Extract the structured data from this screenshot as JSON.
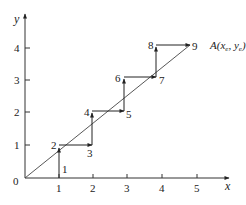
{
  "diagram": {
    "type": "staircase-interpolation",
    "axes": {
      "x_label": "x",
      "y_label": "y",
      "origin_label": "0",
      "x_ticks": [
        "1",
        "2",
        "3",
        "4",
        "5"
      ],
      "y_ticks": [
        "1",
        "2",
        "3",
        "4"
      ]
    },
    "endpoint_label": {
      "prefix": "A(",
      "x": "x",
      "x_sub": "e",
      "sep": ", ",
      "y": "y",
      "y_sub": "e",
      "suffix": ")"
    },
    "steps": [
      {
        "label": "1",
        "x": 1,
        "y": 0
      },
      {
        "label": "2",
        "x": 1,
        "y": 0.9
      },
      {
        "label": "3",
        "x": 1.95,
        "y": 1
      },
      {
        "label": "4",
        "x": 1.95,
        "y": 2.05
      },
      {
        "label": "5",
        "x": 2.9,
        "y": 2.05
      },
      {
        "label": "6",
        "x": 2.9,
        "y": 3.1
      },
      {
        "label": "7",
        "x": 3.85,
        "y": 3.1
      },
      {
        "label": "8",
        "x": 3.85,
        "y": 4.1
      },
      {
        "label": "9",
        "x": 4.85,
        "y": 4.1
      }
    ],
    "colors": {
      "line": "#333333",
      "text": "#222222",
      "background": "#ffffff"
    }
  }
}
